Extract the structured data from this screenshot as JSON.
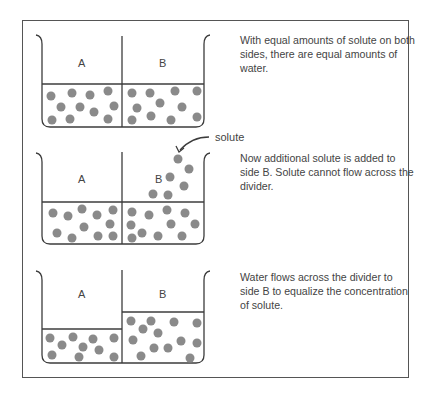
{
  "figure": {
    "panels": [
      {
        "id": "equal",
        "left_label": "A",
        "right_label": "B",
        "caption": "With equal amounts of solute on both sides, there are equal amounts of water."
      },
      {
        "id": "added",
        "left_label": "A",
        "right_label": "B",
        "annotation": "solute",
        "caption": "Now additional solute is added to side B. Solute cannot flow across the divider."
      },
      {
        "id": "equalized",
        "left_label": "A",
        "right_label": "B",
        "caption": "Water flows across the divider to side B to equalize the concentration of solute."
      }
    ]
  },
  "colors": {
    "line": "#3c3c3c",
    "solute": "#8a8a8a",
    "frame": "#555555"
  }
}
